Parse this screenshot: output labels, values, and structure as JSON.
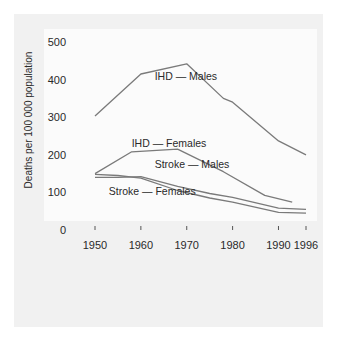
{
  "chart_data": {
    "type": "line",
    "title": "",
    "xlabel": "",
    "ylabel": "Deaths per 100 000 population",
    "xlim": [
      1950,
      1996
    ],
    "ylim": [
      0,
      500
    ],
    "grid": false,
    "legend": "inline-labels",
    "x_ticks": [
      1950,
      1960,
      1970,
      1980,
      1990,
      1996
    ],
    "x_tick_labels": [
      "1950",
      "1960",
      "1970",
      "1980",
      "1990",
      "1996"
    ],
    "y_ticks": [
      0,
      100,
      200,
      300,
      400,
      500
    ],
    "y_tick_labels": [
      "0",
      "100",
      "200",
      "300",
      "400",
      "500"
    ],
    "series": [
      {
        "name": "IHD — Males",
        "x": [
          1950,
          1960,
          1970,
          1978,
          1980,
          1990,
          1996
        ],
        "y": [
          303,
          415,
          442,
          350,
          340,
          237,
          200
        ],
        "label_anchor": [
          1963,
          400
        ]
      },
      {
        "name": "IHD — Females",
        "x": [
          1950,
          1958,
          1968,
          1978,
          1987,
          1993
        ],
        "y": [
          150,
          208,
          215,
          155,
          92,
          74
        ],
        "label_anchor": [
          1958,
          222
        ]
      },
      {
        "name": "Stroke — Males",
        "x": [
          1950,
          1955,
          1960,
          1968,
          1975,
          1980,
          1990,
          1996
        ],
        "y": [
          140,
          140,
          142,
          116,
          97,
          87,
          58,
          55
        ],
        "label_anchor": [
          1963,
          166
        ]
      },
      {
        "name": "Stroke — Females",
        "x": [
          1950,
          1955,
          1960,
          1968,
          1975,
          1980,
          1990,
          1996
        ],
        "y": [
          148,
          145,
          138,
          105,
          85,
          74,
          47,
          45
        ],
        "label_anchor": [
          1953,
          92
        ]
      }
    ]
  },
  "colors": {
    "line": "#7a7a7a",
    "text": "#2a2a2a",
    "outer_panel": "#f1f1f1",
    "plot_panel": "#fbfbfb"
  }
}
